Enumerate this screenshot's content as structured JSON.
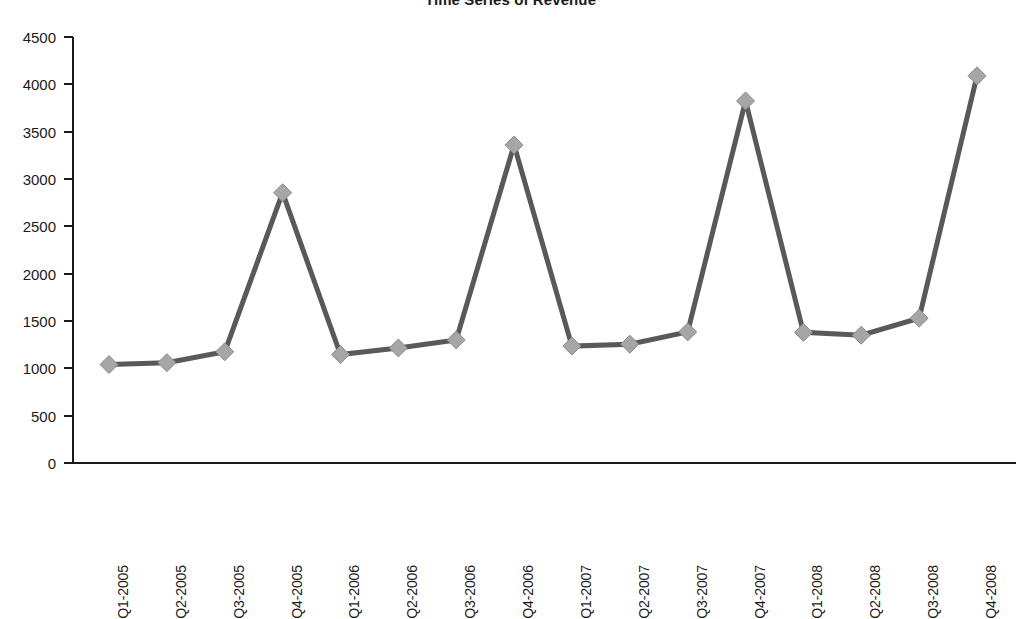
{
  "chart": {
    "title": "Time Series of Revenue",
    "title_clipped": true
  },
  "chart_data": {
    "type": "line",
    "title": "Time Series of Revenue",
    "xlabel": "",
    "ylabel": "",
    "categories": [
      "Q1-2005",
      "Q2-2005",
      "Q3-2005",
      "Q4-2005",
      "Q1-2006",
      "Q2-2006",
      "Q3-2006",
      "Q4-2006",
      "Q1-2007",
      "Q2-2007",
      "Q3-2007",
      "Q4-2007",
      "Q1-2008",
      "Q2-2008",
      "Q3-2008",
      "Q4-2008"
    ],
    "values": [
      1040,
      1060,
      1175,
      2855,
      1145,
      1215,
      1300,
      3360,
      1235,
      1255,
      1385,
      3825,
      1380,
      1350,
      1530,
      4090
    ],
    "series": [
      {
        "name": "Revenue",
        "values": [
          1040,
          1060,
          1175,
          2855,
          1145,
          1215,
          1300,
          3360,
          1235,
          1255,
          1385,
          3825,
          1380,
          1350,
          1530,
          4090
        ],
        "line_color": "#595959",
        "marker_color": "#a6a6a6",
        "marker_shape": "diamond"
      }
    ],
    "ylim": [
      0,
      4500
    ],
    "ytick_values": [
      0,
      500,
      1000,
      1500,
      2000,
      2500,
      3000,
      3500,
      4000,
      4500
    ],
    "ytick_labels": [
      "0",
      "500",
      "1000",
      "1500",
      "2000",
      "2500",
      "3000",
      "3500",
      "4000",
      "4500"
    ],
    "grid": false,
    "legend": false,
    "legend_position": "none"
  },
  "colors": {
    "line": "#595959",
    "marker_fill": "#a6a6a6",
    "marker_edge": "#8c8c8c",
    "axis": "#1a1a1a",
    "text": "#1a1a1a",
    "background": "#ffffff"
  }
}
